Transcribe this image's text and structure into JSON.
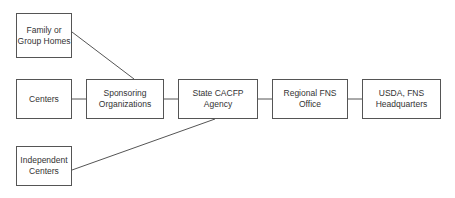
{
  "diagram": {
    "type": "organizational-flow",
    "colors": {
      "line": "#555555",
      "box_border": "#555555",
      "text": "#333333",
      "background": "#ffffff"
    },
    "nodes": [
      {
        "id": "family",
        "lines": [
          "Family or",
          "Group Homes"
        ],
        "x": 16,
        "y": 13,
        "w": 56,
        "h": 45
      },
      {
        "id": "centers",
        "lines": [
          "Centers"
        ],
        "x": 16,
        "y": 79,
        "w": 56,
        "h": 40
      },
      {
        "id": "independent",
        "lines": [
          "Independent",
          "Centers"
        ],
        "x": 16,
        "y": 146,
        "w": 56,
        "h": 40
      },
      {
        "id": "sponsoring",
        "lines": [
          "Sponsoring",
          "Organizations"
        ],
        "x": 86,
        "y": 79,
        "w": 78,
        "h": 40
      },
      {
        "id": "state",
        "lines": [
          "State CACFP",
          "Agency"
        ],
        "x": 178,
        "y": 79,
        "w": 80,
        "h": 40
      },
      {
        "id": "regional",
        "lines": [
          "Regional FNS",
          "Office"
        ],
        "x": 272,
        "y": 79,
        "w": 76,
        "h": 40
      },
      {
        "id": "usda",
        "lines": [
          "USDA, FNS",
          "Headquarters"
        ],
        "x": 362,
        "y": 79,
        "w": 79,
        "h": 40
      }
    ],
    "edges": [
      {
        "from": "family",
        "to": "sponsoring",
        "x1": 72,
        "y1": 32,
        "x2": 134,
        "y2": 79
      },
      {
        "from": "centers",
        "to": "sponsoring",
        "x1": 72,
        "y1": 99,
        "x2": 86,
        "y2": 99
      },
      {
        "from": "sponsoring",
        "to": "state",
        "x1": 164,
        "y1": 99,
        "x2": 178,
        "y2": 99
      },
      {
        "from": "independent",
        "to": "state",
        "x1": 72,
        "y1": 170,
        "x2": 215,
        "y2": 119
      },
      {
        "from": "state",
        "to": "regional",
        "x1": 258,
        "y1": 99,
        "x2": 272,
        "y2": 99
      },
      {
        "from": "regional",
        "to": "usda",
        "x1": 348,
        "y1": 99,
        "x2": 362,
        "y2": 99
      }
    ]
  }
}
